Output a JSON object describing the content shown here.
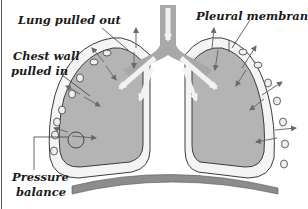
{
  "diagram": {
    "labels": {
      "lung_pulled_out": "Lung pulled out",
      "pleural_membranes": "Pleural membranes",
      "chest_wall_line1": "Chest wall",
      "chest_wall_line2": "pulled in",
      "pressure_line1": "Pressure",
      "pressure_line2": "balance"
    },
    "colors": {
      "lung_fill": "#b4b4b4",
      "pleura_fill": "#f4f4f4",
      "outline": "#3c3c3c",
      "airway": "#a8a8a8",
      "airway_arrow": "#f2f2f2",
      "diaphragm": "#8c8c8c",
      "arrow": "#6a6a6a",
      "rib": "#eeeeee"
    }
  }
}
